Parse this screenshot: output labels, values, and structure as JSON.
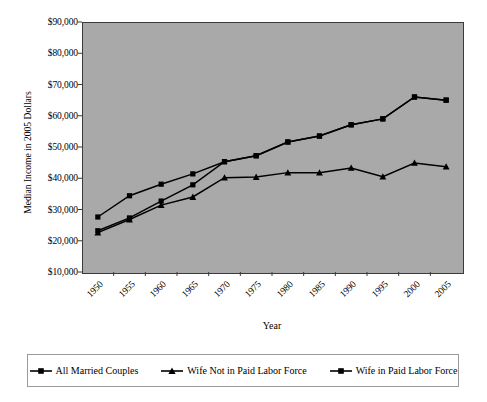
{
  "chart_data": {
    "type": "line",
    "title": "",
    "xlabel": "Year",
    "ylabel": "Median Income in 2005 Dollars",
    "categories": [
      "1950",
      "1955",
      "1960",
      "1965",
      "1970",
      "1975",
      "1980",
      "1985",
      "1990",
      "1995",
      "2000",
      "2005"
    ],
    "ylim": [
      10000,
      90000
    ],
    "ytick_labels": [
      "$10,000",
      "$20,000",
      "$30,000",
      "$40,000",
      "$50,000",
      "$60,000",
      "$70,000",
      "$80,000",
      "$90,000"
    ],
    "ytick_values": [
      10000,
      20000,
      30000,
      40000,
      50000,
      60000,
      70000,
      80000,
      90000
    ],
    "grid": false,
    "legend_position": "bottom",
    "plot_background": "#a9a9a9",
    "line_color": "#000000",
    "series": [
      {
        "name": "All Married Couples",
        "marker": "square",
        "values": [
          27600,
          34400,
          38100,
          41400,
          45300,
          47200,
          51600,
          53500,
          57100,
          59000,
          66000,
          65000
        ]
      },
      {
        "name": "Wife Not in Paid Labor Force",
        "marker": "triangle",
        "values": [
          22600,
          26800,
          31400,
          34000,
          40200,
          40400,
          41800,
          41800,
          43300,
          40500,
          44900,
          43700
        ]
      },
      {
        "name": "Wife in Paid Labor Force",
        "marker": "square",
        "values": [
          23200,
          27300,
          32700,
          37900,
          45300,
          47200,
          51600,
          53500,
          57100,
          59000,
          66000,
          65000
        ]
      }
    ]
  },
  "legend": {
    "entries": [
      {
        "label": "All Married Couples",
        "marker": "square"
      },
      {
        "label": "Wife Not in Paid Labor Force",
        "marker": "triangle"
      },
      {
        "label": "Wife in Paid Labor Force",
        "marker": "square"
      }
    ]
  }
}
